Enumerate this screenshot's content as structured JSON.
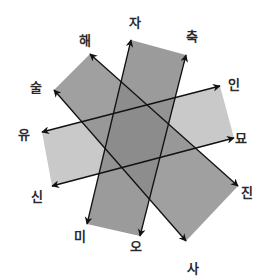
{
  "diagram": {
    "labels": {
      "ja": "자",
      "chuk": "축",
      "in": "인",
      "myo": "묘",
      "jin": "진",
      "sa": "사",
      "o": "오",
      "mi": "미",
      "sin": "신",
      "yu": "유",
      "sul": "술",
      "hae": "해"
    },
    "bands": [
      {
        "name": "vertical-band",
        "color": "#8c8c8c",
        "corners": [
          "자",
          "축",
          "오",
          "미"
        ],
        "arrows": [
          [
            "자",
            "미"
          ],
          [
            "축",
            "오"
          ]
        ]
      },
      {
        "name": "nw-se-band",
        "color": "#9a9a9a",
        "corners": [
          "해",
          "술",
          "사",
          "진"
        ],
        "arrows": [
          [
            "해",
            "진"
          ],
          [
            "술",
            "사"
          ]
        ]
      },
      {
        "name": "ene-band",
        "color": "#c4c4c4",
        "corners": [
          "인",
          "묘",
          "신",
          "유"
        ],
        "arrows": [
          [
            "유",
            "인"
          ],
          [
            "신",
            "묘"
          ]
        ]
      }
    ],
    "colors": {
      "light_band": "#c8c8c8",
      "mid_band": "#9e9e9e",
      "dark_band": "#8a8a8a",
      "arrow": "#111111",
      "label": "#2a2a2a"
    }
  }
}
